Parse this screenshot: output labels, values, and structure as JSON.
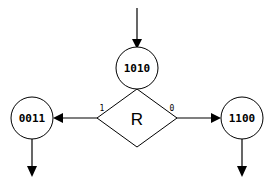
{
  "diagram": {
    "type": "state-transition-diagram",
    "background_color": "#ffffff",
    "stroke_color": "#000000",
    "nodes": [
      {
        "id": "top",
        "label": "1010",
        "shape": "circle",
        "cx": 137,
        "cy": 68,
        "r": 21
      },
      {
        "id": "left",
        "label": "0011",
        "shape": "circle",
        "cx": 32,
        "cy": 118,
        "r": 21
      },
      {
        "id": "right",
        "label": "1100",
        "shape": "circle",
        "cx": 242,
        "cy": 118,
        "r": 21
      },
      {
        "id": "decision",
        "label": "R",
        "shape": "diamond",
        "cx": 137,
        "cy": 118,
        "hw": 40,
        "hh": 29
      }
    ],
    "edges": [
      {
        "id": "entry",
        "label": "",
        "from": "input",
        "to": "top"
      },
      {
        "id": "branch-one",
        "label": "1",
        "from": "decision",
        "to": "left"
      },
      {
        "id": "branch-zero",
        "label": "0",
        "from": "decision",
        "to": "right"
      },
      {
        "id": "exit-left",
        "label": "",
        "from": "left",
        "to": "output"
      },
      {
        "id": "exit-right",
        "label": "",
        "from": "right",
        "to": "output"
      }
    ]
  }
}
